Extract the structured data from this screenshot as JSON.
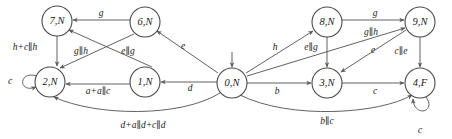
{
  "diagram": {
    "type": "state-transition-graph",
    "width": 452,
    "height": 139,
    "colors": {
      "background": "#ffffff",
      "node_stroke": "#4a4a4a",
      "edge_stroke": "#5a5a5a",
      "text": "#1a1a1a"
    },
    "nodes": [
      {
        "id": "n7",
        "label": "7,N",
        "x": 57,
        "y": 21,
        "r": 15
      },
      {
        "id": "n6",
        "label": "6,N",
        "x": 145,
        "y": 22,
        "r": 15
      },
      {
        "id": "n8",
        "label": "8,N",
        "x": 327,
        "y": 22,
        "r": 15
      },
      {
        "id": "n9",
        "label": "9,N",
        "x": 420,
        "y": 22,
        "r": 15
      },
      {
        "id": "n2",
        "label": "2,N",
        "x": 50,
        "y": 82,
        "r": 15
      },
      {
        "id": "n1",
        "label": "1,N",
        "x": 145,
        "y": 82,
        "r": 15
      },
      {
        "id": "n0",
        "label": "0,N",
        "x": 232,
        "y": 83,
        "r": 15
      },
      {
        "id": "n3",
        "label": "3,N",
        "x": 327,
        "y": 83,
        "r": 15
      },
      {
        "id": "n4",
        "label": "4,F",
        "x": 420,
        "y": 83,
        "r": 15
      }
    ],
    "edge_labels": [
      {
        "id": "lbl-6-to-7",
        "text": "g",
        "x": 101,
        "y": 14
      },
      {
        "id": "lbl-8-to-9",
        "text": "g",
        "x": 375,
        "y": 14
      },
      {
        "id": "lbl-7-to-2",
        "text": "h+c∥h",
        "x": 25,
        "y": 48
      },
      {
        "id": "lbl-6-to-2",
        "text": "g∥h",
        "x": 81,
        "y": 52
      },
      {
        "id": "lbl-0-to-6",
        "text": "e",
        "x": 183,
        "y": 47
      },
      {
        "id": "lbl-1-to-7",
        "text": "e∥g",
        "x": 128,
        "y": 52
      },
      {
        "id": "lbl-0-to-8",
        "text": "h",
        "x": 275,
        "y": 48
      },
      {
        "id": "lbl-3-to-8",
        "text": "e∥g",
        "x": 311,
        "y": 48
      },
      {
        "id": "lbl-9-to-3",
        "text": "g∥h",
        "x": 371,
        "y": 33
      },
      {
        "id": "lbl-0-to-9",
        "text": "e",
        "x": 373,
        "y": 51
      },
      {
        "id": "lbl-9-to-4",
        "text": "c∥e",
        "x": 401,
        "y": 52
      },
      {
        "id": "lbl-2-self",
        "text": "c",
        "x": 10,
        "y": 82
      },
      {
        "id": "lbl-1-to-2",
        "text": "a+a∥c",
        "x": 98,
        "y": 92
      },
      {
        "id": "lbl-0-to-1",
        "text": "d",
        "x": 190,
        "y": 89
      },
      {
        "id": "lbl-0-to-3",
        "text": "b",
        "x": 277,
        "y": 92
      },
      {
        "id": "lbl-3-to-4",
        "text": "c",
        "x": 375,
        "y": 92
      },
      {
        "id": "lbl-0-to-2",
        "text": "d+a∥d+c∥d",
        "x": 143,
        "y": 126
      },
      {
        "id": "lbl-0-to-4",
        "text": "b∥c",
        "x": 327,
        "y": 122
      },
      {
        "id": "lbl-4-self",
        "text": "c",
        "x": 420,
        "y": 131
      }
    ],
    "transitions": [
      {
        "from": "6,N",
        "to": "7,N",
        "label": "g"
      },
      {
        "from": "8,N",
        "to": "9,N",
        "label": "g"
      },
      {
        "from": "7,N",
        "to": "2,N",
        "label": "h+c∥h"
      },
      {
        "from": "6,N",
        "to": "2,N",
        "label": "g∥h"
      },
      {
        "from": "0,N",
        "to": "6,N",
        "label": "e"
      },
      {
        "from": "1,N",
        "to": "7,N",
        "label": "e∥g"
      },
      {
        "from": "0,N",
        "to": "8,N",
        "label": "h"
      },
      {
        "from": "3,N",
        "to": "8,N",
        "label": "e∥g"
      },
      {
        "from": "9,N",
        "to": "3,N",
        "label": "g∥h"
      },
      {
        "from": "0,N",
        "to": "9,N",
        "label": "e"
      },
      {
        "from": "9,N",
        "to": "4,F",
        "label": "c∥e"
      },
      {
        "from": "2,N",
        "to": "2,N",
        "label": "c"
      },
      {
        "from": "1,N",
        "to": "2,N",
        "label": "a+a∥c"
      },
      {
        "from": "0,N",
        "to": "1,N",
        "label": "d"
      },
      {
        "from": "0,N",
        "to": "3,N",
        "label": "b"
      },
      {
        "from": "3,N",
        "to": "4,F",
        "label": "c"
      },
      {
        "from": "0,N",
        "to": "2,N",
        "label": "d+a∥d+c∥d"
      },
      {
        "from": "0,N",
        "to": "4,F",
        "label": "b∥c"
      },
      {
        "from": "4,F",
        "to": "4,F",
        "label": "c"
      }
    ],
    "start_state": "0,N",
    "accepting_states": [
      "4,F"
    ]
  }
}
